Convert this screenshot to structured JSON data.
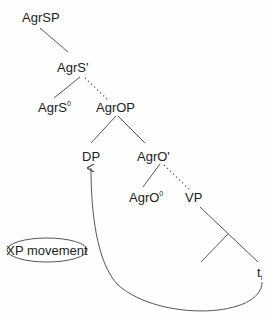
{
  "diagram": {
    "type": "syntax-tree",
    "nodes": {
      "agrsp": {
        "text": "AgrSP"
      },
      "agrs_bar": {
        "text": "AgrS'"
      },
      "agrs0": {
        "text": "AgrS",
        "sup": "0"
      },
      "agrop": {
        "text": "AgrOP"
      },
      "dp": {
        "text": "DP"
      },
      "agro_bar": {
        "text": "AgrO'"
      },
      "agro0": {
        "text": "AgrO",
        "sup": "0"
      },
      "vp": {
        "text": "VP"
      },
      "trace": {
        "text": "t",
        "sub": "i"
      }
    },
    "edges": [
      {
        "from": "AgrSP",
        "to": "AgrS'",
        "style": "solid"
      },
      {
        "from": "AgrS'",
        "to": "AgrS0",
        "style": "solid"
      },
      {
        "from": "AgrS'",
        "to": "AgrOP",
        "style": "dotted"
      },
      {
        "from": "AgrOP",
        "to": "DP",
        "style": "solid"
      },
      {
        "from": "AgrOP",
        "to": "AgrO'",
        "style": "solid"
      },
      {
        "from": "AgrO'",
        "to": "AgrO0",
        "style": "solid"
      },
      {
        "from": "AgrO'",
        "to": "VP",
        "style": "dotted"
      },
      {
        "from": "VP",
        "to": "t_i",
        "style": "solid"
      },
      {
        "from": "VP-branch",
        "to": "left-leaf",
        "style": "solid"
      }
    ],
    "movement_arrow": {
      "from": "t_i",
      "to": "DP"
    },
    "legend": {
      "text": "XP movement"
    }
  }
}
